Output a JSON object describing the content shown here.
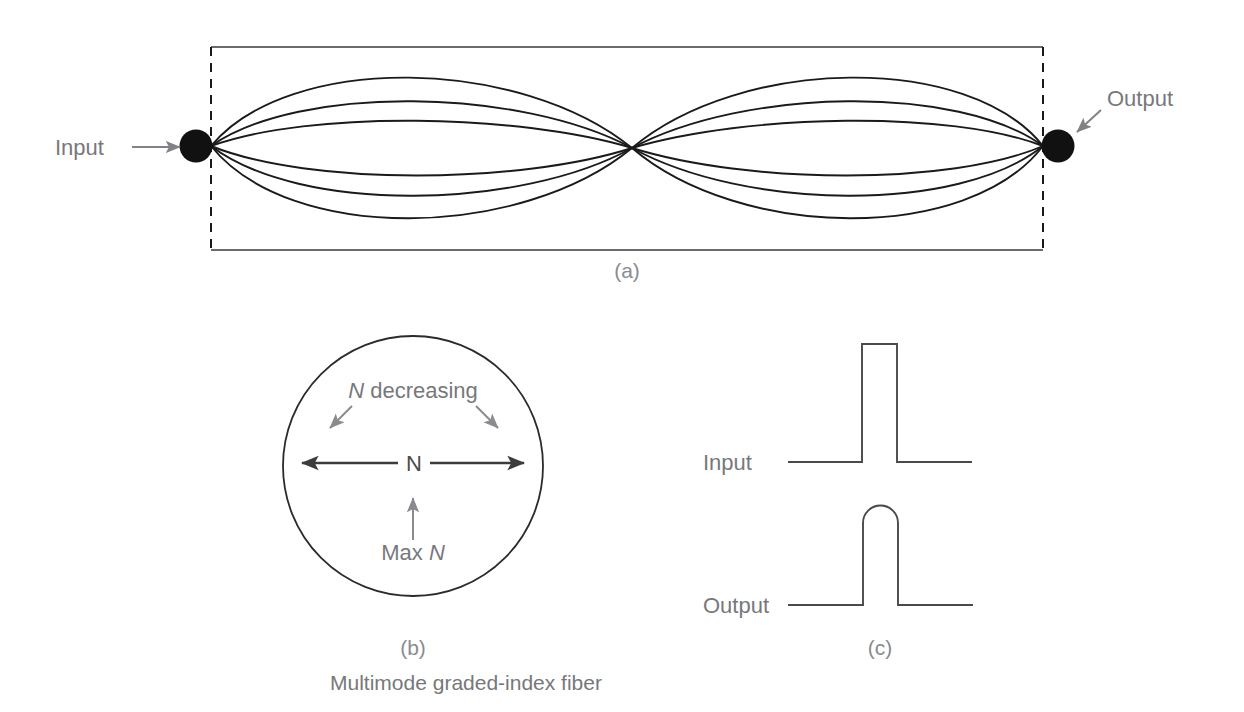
{
  "figure": {
    "caption": "Multimode graded-index fiber",
    "panels": [
      {
        "tag": "(a)",
        "name": "ray-propagation-panel"
      },
      {
        "tag": "(b)",
        "name": "index-profile-panel"
      },
      {
        "tag": "(c)",
        "name": "pulse-shape-panel"
      }
    ]
  },
  "panel_a": {
    "tag": "(a)",
    "input_label": "Input",
    "output_label": "Output",
    "input_arrow": "right-arrow-icon",
    "output_arrow": "down-left-arrow-icon",
    "input_dot": "fiber-input-node",
    "output_dot": "fiber-output-node",
    "ray_count": 6,
    "stroke_color": "#1a1a1a"
  },
  "panel_b": {
    "tag": "(b)",
    "top_label": "N decreasing",
    "top_label_italic_part": "N",
    "center_label": "N",
    "bottom_label": "Max N",
    "bottom_label_italic_part": "N",
    "left_arrow": "left-arrow-icon",
    "right_arrow": "right-arrow-icon",
    "up_arrow": "up-arrow-icon",
    "diagonal_arrows": [
      "down-left-arrow-icon",
      "down-right-arrow-icon"
    ],
    "outline_color": "#2b2b2b"
  },
  "panel_c": {
    "tag": "(c)",
    "input_label": "Input",
    "output_label": "Output",
    "input_waveform": "square-pulse",
    "output_waveform": "rounded-pulse",
    "stroke_color": "#4a4a4c"
  }
}
